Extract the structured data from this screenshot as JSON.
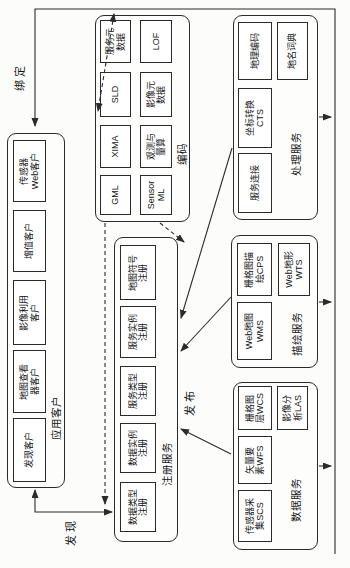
{
  "diagram": {
    "kind": "OGC web service architecture flowchart (rotated 90°)",
    "colors": {
      "line": "#2b2b2b",
      "background": "#fcfcfa"
    }
  },
  "edge_labels": {
    "bind": "绑定",
    "find": "发现",
    "publish": "发布"
  },
  "groups": {
    "clients": {
      "label": "应用客户",
      "boxes": [
        {
          "text": "发现客户"
        },
        {
          "text": "地图查看\n器客户"
        },
        {
          "text": "影像利用\n客户"
        },
        {
          "text": "增值客户"
        },
        {
          "text": "传感器\nWeb客户"
        }
      ]
    },
    "registry": {
      "label": "注册服务",
      "boxes": [
        {
          "text": "数据类型\n注册"
        },
        {
          "text": "数据实例\n注册"
        },
        {
          "text": "服务类型\n注册"
        },
        {
          "text": "服务实例\n注册"
        },
        {
          "text": "地图符号\n注册"
        }
      ]
    },
    "encodings": {
      "label": "编码",
      "row1": [
        {
          "text": "GML"
        },
        {
          "text": "XIMA"
        },
        {
          "text": "SLD"
        },
        {
          "text": "服务元\n数据"
        }
      ],
      "row2": [
        {
          "text": "Sensor\nML"
        },
        {
          "text": "观测与\n量算"
        },
        {
          "text": "影像元\n数据"
        },
        {
          "text": "LOF"
        }
      ]
    },
    "processing": {
      "label": "处理服务",
      "boxes": [
        {
          "text": "服务连接"
        },
        {
          "text": "坐标转换\nCTS"
        },
        {
          "text": "地理编码"
        },
        {
          "text": "地名词典"
        }
      ]
    },
    "portrayal": {
      "label": "描绘服务",
      "boxes": [
        {
          "text": "Web地图\nWMS"
        },
        {
          "text": "栅格图描\n绘CPS"
        },
        {
          "text": "Web地形\nWTS"
        }
      ]
    },
    "data_services": {
      "label": "数据服务",
      "boxes": [
        {
          "text": "传感器采\n集SCS"
        },
        {
          "text": "矢量要\n素WFS"
        },
        {
          "text": "栅格图\n层WCS"
        },
        {
          "text": "影像分\n析LAS"
        }
      ]
    }
  }
}
